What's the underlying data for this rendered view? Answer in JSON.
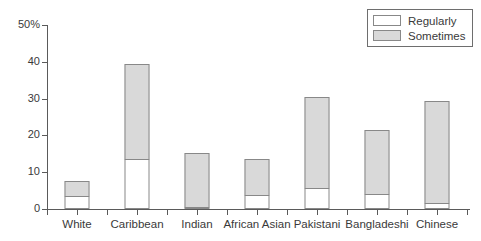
{
  "chart_data": {
    "type": "bar",
    "stacked": true,
    "title": "",
    "xlabel": "",
    "ylabel": "",
    "ylim": [
      0,
      50
    ],
    "yticks": [
      0,
      10,
      20,
      30,
      40,
      50
    ],
    "ytick_labels": [
      "0",
      "10",
      "20",
      "30",
      "40",
      "50%"
    ],
    "grid": false,
    "legend_position": "top-right",
    "categories": [
      "White",
      "Caribbean",
      "Indian",
      "African Asian",
      "Pakistani",
      "Bangladeshi",
      "Chinese"
    ],
    "series": [
      {
        "name": "Regularly",
        "color": "#ffffff",
        "values": [
          3.5,
          13.7,
          0.6,
          3.8,
          5.8,
          4.0,
          1.6
        ]
      },
      {
        "name": "Sometimes",
        "color": "#d9d9d9",
        "values": [
          4.5,
          26.1,
          15.0,
          10.2,
          24.9,
          17.8,
          28.0
        ]
      }
    ],
    "totals": [
      8.0,
      39.8,
      15.6,
      14.0,
      30.7,
      21.8,
      29.6
    ]
  },
  "legend": {
    "items": [
      {
        "label": "Regularly",
        "swatch": "regularly"
      },
      {
        "label": "Sometimes",
        "swatch": "sometimes"
      }
    ]
  },
  "axes": {
    "y_tick_labels": [
      "50%",
      "40",
      "30",
      "20",
      "10",
      "0"
    ],
    "x_tick_labels": [
      "White",
      "Caribbean",
      "Indian",
      "African Asian",
      "Pakistani",
      "Bangladeshi",
      "Chinese"
    ]
  }
}
